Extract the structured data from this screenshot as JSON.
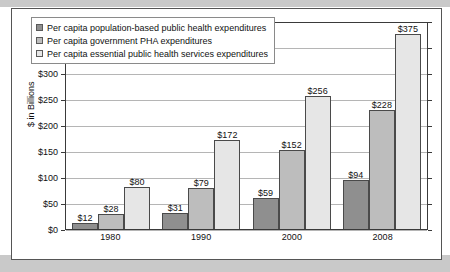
{
  "chart_data": {
    "type": "bar",
    "title": "",
    "xlabel": "",
    "ylabel": "$ in Billions",
    "ylim": [
      0,
      400
    ],
    "ytick_step": 50,
    "grid": true,
    "legend_position": "top-left",
    "categories": [
      "1980",
      "1990",
      "2000",
      "2008"
    ],
    "ytick_labels": [
      "$0",
      "$50",
      "$100",
      "$150",
      "$200",
      "$250",
      "$300",
      "$350",
      "$400"
    ],
    "ytick_values": [
      0,
      50,
      100,
      150,
      200,
      250,
      300,
      350,
      400
    ],
    "series": [
      {
        "name": "Per capita population-based public health expenditures",
        "color": "#8f8f8f",
        "values": [
          12,
          31,
          59,
          94
        ],
        "labels": [
          "$12",
          "$31",
          "$59",
          "$94"
        ]
      },
      {
        "name": "Per capita government PHA expenditures",
        "color": "#bdbdbd",
        "values": [
          28,
          79,
          152,
          228
        ],
        "labels": [
          "$28",
          "$79",
          "$152",
          "$228"
        ]
      },
      {
        "name": "Per capita essential public health services expenditures",
        "color": "#e6e6e6",
        "values": [
          80,
          172,
          256,
          375
        ],
        "labels": [
          "$80",
          "$172",
          "$256",
          "$375"
        ]
      }
    ]
  }
}
